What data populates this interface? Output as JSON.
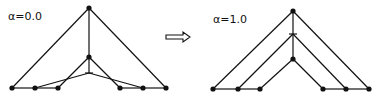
{
  "diagrams": [
    {
      "label": "α=0.0",
      "label_pos": [
        8,
        20
      ],
      "nodes": [
        {
          "id": "apex",
          "x": 89,
          "y": 8,
          "type": "dot"
        },
        {
          "id": "mid",
          "x": 89,
          "y": 57,
          "type": "dot"
        },
        {
          "id": "cross",
          "x": 89,
          "y": 73,
          "type": "cross"
        },
        {
          "id": "l1",
          "x": 12,
          "y": 88,
          "type": "dot"
        },
        {
          "id": "l2",
          "x": 35,
          "y": 88,
          "type": "dot"
        },
        {
          "id": "l3",
          "x": 58,
          "y": 88,
          "type": "dot"
        },
        {
          "id": "r3",
          "x": 120,
          "y": 88,
          "type": "dot"
        },
        {
          "id": "r2",
          "x": 143,
          "y": 88,
          "type": "dot"
        },
        {
          "id": "r1",
          "x": 166,
          "y": 88,
          "type": "dot"
        }
      ],
      "edges": [
        [
          "apex",
          "l1"
        ],
        [
          "apex",
          "r1"
        ],
        [
          "apex",
          "mid"
        ],
        [
          "mid",
          "cross"
        ],
        [
          "l1",
          "l2"
        ],
        [
          "l2",
          "l3"
        ],
        [
          "r3",
          "r2"
        ],
        [
          "r2",
          "r1"
        ],
        [
          "mid",
          "l3"
        ],
        [
          "mid",
          "r3"
        ],
        [
          "cross",
          "l2"
        ],
        [
          "cross",
          "r2"
        ]
      ]
    },
    {
      "label": "α=1.0",
      "label_pos": [
        213,
        23
      ],
      "nodes": [
        {
          "id": "apex",
          "x": 293,
          "y": 11,
          "type": "dot"
        },
        {
          "id": "cross",
          "x": 293,
          "y": 34,
          "type": "cross"
        },
        {
          "id": "mid",
          "x": 293,
          "y": 59,
          "type": "dot"
        },
        {
          "id": "l1",
          "x": 213,
          "y": 89,
          "type": "dot"
        },
        {
          "id": "l2",
          "x": 238,
          "y": 89,
          "type": "dot"
        },
        {
          "id": "l3",
          "x": 260,
          "y": 89,
          "type": "dot"
        },
        {
          "id": "r3",
          "x": 323,
          "y": 89,
          "type": "dot"
        },
        {
          "id": "r2",
          "x": 346,
          "y": 89,
          "type": "dot"
        },
        {
          "id": "r1",
          "x": 369,
          "y": 89,
          "type": "dot"
        }
      ],
      "edges": [
        [
          "apex",
          "l1"
        ],
        [
          "apex",
          "r1"
        ],
        [
          "apex",
          "cross"
        ],
        [
          "cross",
          "mid"
        ],
        [
          "l1",
          "l2"
        ],
        [
          "l2",
          "l3"
        ],
        [
          "r3",
          "r2"
        ],
        [
          "r2",
          "r1"
        ],
        [
          "cross",
          "l2"
        ],
        [
          "cross",
          "r2"
        ],
        [
          "mid",
          "l3"
        ],
        [
          "mid",
          "r3"
        ]
      ]
    }
  ],
  "arrow": {
    "symbol": "⇨",
    "x1": 166,
    "x2": 190,
    "y": 37
  }
}
